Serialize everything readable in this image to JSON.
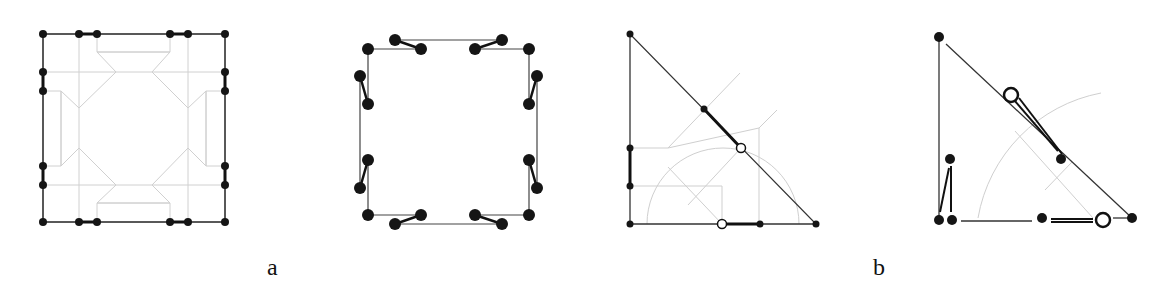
{
  "labels": {
    "a": "a",
    "b": "b"
  },
  "colors": {
    "edge": "#222222",
    "guide": "#c8c8c8",
    "node": "#151515"
  },
  "panels": [
    {
      "id": "a-left",
      "type": "square-mesh",
      "nodes": 24
    },
    {
      "id": "a-right",
      "type": "square-perturbed",
      "nodes": 24
    },
    {
      "id": "b-left",
      "type": "triangle-mesh",
      "nodes": 9,
      "open_nodes": 2
    },
    {
      "id": "b-right",
      "type": "triangle-perturbed",
      "nodes": 9,
      "open_nodes": 2
    }
  ]
}
